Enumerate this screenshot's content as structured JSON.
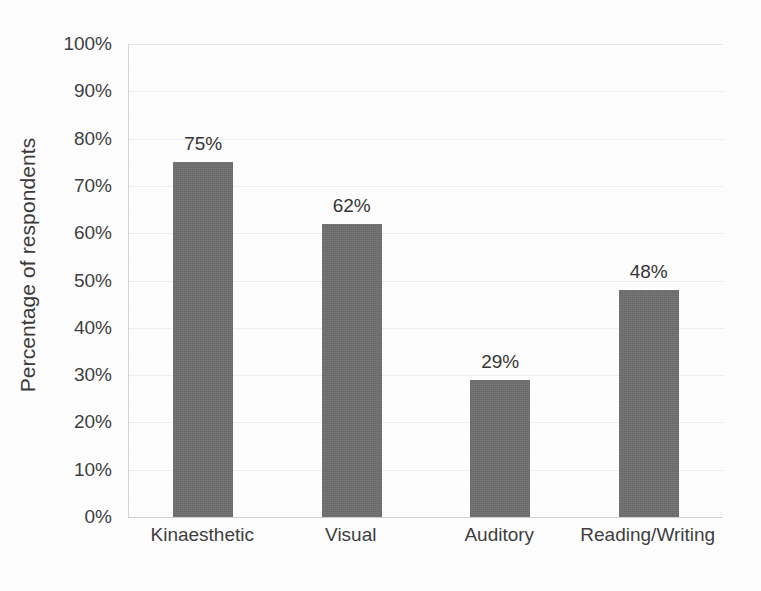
{
  "chart_data": {
    "type": "bar",
    "title": "",
    "xlabel": "",
    "ylabel": "Percentage of respondents",
    "categories": [
      "Kinaesthetic",
      "Visual",
      "Auditory",
      "Reading/Writing"
    ],
    "values": [
      75,
      62,
      29,
      48
    ],
    "data_labels": [
      "75%",
      "62%",
      "29%",
      "48%"
    ],
    "ylim": [
      0,
      100
    ],
    "ytick_labels": [
      "0%",
      "10%",
      "20%",
      "30%",
      "40%",
      "50%",
      "60%",
      "70%",
      "80%",
      "90%",
      "100%"
    ],
    "ytick_values": [
      0,
      10,
      20,
      30,
      40,
      50,
      60,
      70,
      80,
      90,
      100
    ],
    "grid": true,
    "legend": "none",
    "bar_color": "#6e6e6e",
    "gridline_color": "#ededed",
    "axis_color": "#d0d0d0",
    "background_color": "#fdfdfd",
    "text_color": "#3b3b3b"
  }
}
